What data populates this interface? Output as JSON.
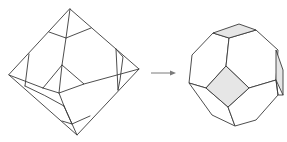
{
  "diagram": {
    "left_figure": {
      "name": "octahedron-with-truncation-lines",
      "style": "wireframe",
      "stroke_color": "#3a3a3a"
    },
    "arrow": {
      "direction": "right",
      "color": "#7a7a7a"
    },
    "right_figure": {
      "name": "truncated-octahedron",
      "style": "shaded-solid",
      "square_face_color": "#e6e6e6",
      "hexagon_face_color": "#ffffff",
      "stroke_color": "#3a3a3a"
    }
  }
}
